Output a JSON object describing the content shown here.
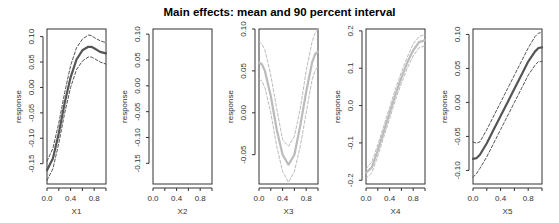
{
  "chart_data": [
    {
      "type": "line",
      "title": "Main effects: mean and 90 percent interval",
      "xlabel": "X1",
      "ylabel": "response",
      "xlim": [
        0,
        1
      ],
      "ylim": [
        -0.19,
        0.115
      ],
      "xticks": [
        0.0,
        0.2,
        0.4,
        0.6,
        0.8,
        1.0
      ],
      "xtick_labels": [
        "0.0",
        "0.4",
        "0.8"
      ],
      "yticks": [
        -0.15,
        -0.1,
        -0.05,
        0.0,
        0.05,
        0.1
      ],
      "ytick_labels": [
        "-0.15",
        "-0.10",
        "-0.05",
        "0.00",
        "0.05",
        "0.10"
      ],
      "line_color": "#555555",
      "x": [
        0.0,
        0.1,
        0.2,
        0.3,
        0.4,
        0.5,
        0.6,
        0.7,
        0.75,
        0.8,
        0.9,
        1.0
      ],
      "series": [
        {
          "name": "mean",
          "style": "solid",
          "values": [
            -0.163,
            -0.14,
            -0.09,
            -0.03,
            0.02,
            0.055,
            0.073,
            0.08,
            0.08,
            0.077,
            0.07,
            0.067
          ]
        },
        {
          "name": "upper 95%",
          "style": "dashed",
          "values": [
            -0.145,
            -0.12,
            -0.07,
            -0.01,
            0.043,
            0.078,
            0.095,
            0.103,
            0.102,
            0.098,
            0.092,
            0.088
          ]
        },
        {
          "name": "lower 5%",
          "style": "dashed",
          "values": [
            -0.183,
            -0.16,
            -0.11,
            -0.05,
            0.0,
            0.035,
            0.052,
            0.06,
            0.06,
            0.057,
            0.05,
            0.046
          ]
        }
      ]
    },
    {
      "type": "line",
      "title": "",
      "xlabel": "X2",
      "ylabel": "response",
      "xlim": [
        0,
        1
      ],
      "ylim": [
        -0.19,
        0.11
      ],
      "xticks": [
        0.0,
        0.2,
        0.4,
        0.6,
        0.8,
        1.0
      ],
      "xtick_labels": [
        "0.0",
        "0.4",
        "0.8"
      ],
      "yticks": [
        -0.15,
        -0.1,
        -0.05,
        0.0,
        0.05,
        0.1
      ],
      "ytick_labels": [
        "-0.15",
        "-0.10",
        "-0.05",
        "0.00",
        "0.05",
        "0.10"
      ],
      "line_color": "#555555",
      "x": [],
      "series": []
    },
    {
      "type": "line",
      "title": "",
      "xlabel": "X3",
      "ylabel": "response",
      "xlim": [
        0,
        1
      ],
      "ylim": [
        -0.085,
        0.1
      ],
      "xticks": [
        0.0,
        0.2,
        0.4,
        0.6,
        0.8,
        1.0
      ],
      "xtick_labels": [
        "0.0",
        "0.4",
        "0.8"
      ],
      "yticks": [
        -0.05,
        0.0,
        0.05,
        0.1
      ],
      "ytick_labels": [
        "-0.05",
        "0.00",
        "0.05",
        "0.10"
      ],
      "line_color": "#bbbbbb",
      "x": [
        0.0,
        0.05,
        0.1,
        0.2,
        0.3,
        0.4,
        0.5,
        0.6,
        0.7,
        0.8,
        0.9,
        0.95,
        1.0
      ],
      "series": [
        {
          "name": "mean",
          "style": "solid",
          "values": [
            0.06,
            0.058,
            0.05,
            0.02,
            -0.02,
            -0.05,
            -0.062,
            -0.05,
            -0.015,
            0.025,
            0.06,
            0.07,
            0.073
          ]
        },
        {
          "name": "upper 95%",
          "style": "dashed",
          "values": [
            0.085,
            0.082,
            0.075,
            0.045,
            0.005,
            -0.032,
            -0.04,
            -0.028,
            0.005,
            0.05,
            0.085,
            0.095,
            0.1
          ]
        },
        {
          "name": "lower 5%",
          "style": "dashed",
          "values": [
            0.04,
            0.038,
            0.03,
            0.0,
            -0.04,
            -0.07,
            -0.083,
            -0.07,
            -0.04,
            0.0,
            0.04,
            0.05,
            0.055
          ]
        }
      ]
    },
    {
      "type": "line",
      "title": "",
      "xlabel": "X4",
      "ylabel": "response",
      "xlim": [
        0,
        1
      ],
      "ylim": [
        -0.21,
        0.205
      ],
      "xticks": [
        0.0,
        0.2,
        0.4,
        0.6,
        0.8,
        1.0
      ],
      "xtick_labels": [
        "0.0",
        "0.4",
        "0.8"
      ],
      "yticks": [
        -0.2,
        -0.1,
        0.0,
        0.1,
        0.2
      ],
      "ytick_labels": [
        "-0.2",
        "-0.1",
        "0.0",
        "0.1",
        "0.2"
      ],
      "line_color": "#bbbbbb",
      "x": [
        0.0,
        0.1,
        0.2,
        0.3,
        0.4,
        0.5,
        0.6,
        0.7,
        0.8,
        0.9,
        1.0
      ],
      "series": [
        {
          "name": "mean",
          "style": "solid",
          "values": [
            -0.18,
            -0.165,
            -0.12,
            -0.07,
            -0.02,
            0.03,
            0.075,
            0.115,
            0.148,
            0.17,
            0.175
          ]
        },
        {
          "name": "upper 95%",
          "style": "dashed",
          "values": [
            -0.17,
            -0.15,
            -0.105,
            -0.055,
            -0.005,
            0.045,
            0.09,
            0.13,
            0.165,
            0.185,
            0.19
          ]
        },
        {
          "name": "lower 5%",
          "style": "dashed",
          "values": [
            -0.195,
            -0.18,
            -0.135,
            -0.085,
            -0.035,
            0.015,
            0.06,
            0.1,
            0.133,
            0.155,
            0.16
          ]
        }
      ]
    },
    {
      "type": "line",
      "title": "",
      "xlabel": "X5",
      "ylabel": "response",
      "xlim": [
        0,
        1
      ],
      "ylim": [
        -0.12,
        0.108
      ],
      "xticks": [
        0.0,
        0.2,
        0.4,
        0.6,
        0.8,
        1.0
      ],
      "xtick_labels": [
        "0.0",
        "0.4",
        "0.8"
      ],
      "yticks": [
        -0.1,
        -0.05,
        0.0,
        0.05,
        0.1
      ],
      "ytick_labels": [
        "-0.10",
        "-0.05",
        "0.00",
        "0.05",
        "0.10"
      ],
      "line_color": "#555555",
      "x": [
        0.0,
        0.05,
        0.1,
        0.2,
        0.3,
        0.4,
        0.5,
        0.6,
        0.7,
        0.8,
        0.9,
        0.95,
        1.0
      ],
      "series": [
        {
          "name": "mean",
          "style": "solid",
          "values": [
            -0.083,
            -0.082,
            -0.077,
            -0.06,
            -0.04,
            -0.02,
            0.0,
            0.02,
            0.04,
            0.06,
            0.075,
            0.08,
            0.081
          ]
        },
        {
          "name": "upper 95%",
          "style": "dashed",
          "values": [
            -0.058,
            -0.06,
            -0.058,
            -0.04,
            -0.02,
            0.0,
            0.02,
            0.04,
            0.06,
            0.08,
            0.097,
            0.102,
            0.103
          ]
        },
        {
          "name": "lower 5%",
          "style": "dashed",
          "values": [
            -0.11,
            -0.105,
            -0.097,
            -0.08,
            -0.06,
            -0.04,
            -0.02,
            0.0,
            0.02,
            0.04,
            0.055,
            0.06,
            0.06
          ]
        }
      ]
    }
  ],
  "layout": {
    "panels": [
      {
        "left": 47,
        "right": 106,
        "top": 29,
        "bottom": 184
      },
      {
        "left": 153,
        "right": 212,
        "top": 29,
        "bottom": 184
      },
      {
        "left": 259,
        "right": 318,
        "top": 29,
        "bottom": 184
      },
      {
        "left": 366,
        "right": 425,
        "top": 29,
        "bottom": 184
      },
      {
        "left": 473,
        "right": 542,
        "top": 29,
        "bottom": 184
      }
    ]
  },
  "header": {
    "title": "Main effects: mean and 90 percent interval"
  }
}
